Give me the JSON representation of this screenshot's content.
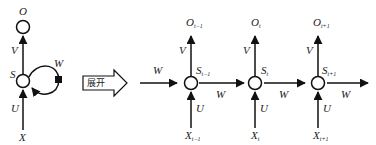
{
  "diagram": {
    "type": "rnn-unfold",
    "folded": {
      "output": "O",
      "state": "S",
      "input": "X",
      "weights": {
        "input_to_state": "U",
        "state_to_output": "V",
        "recurrent": "W"
      }
    },
    "unfold_arrow_label": "展开",
    "unrolled": [
      {
        "output": "O",
        "output_sub": "t−1",
        "state": "S",
        "state_sub": "t−1",
        "input": "X",
        "input_sub": "t−1"
      },
      {
        "output": "O",
        "output_sub": "t",
        "state": "S",
        "state_sub": "t",
        "input": "X",
        "input_sub": "t"
      },
      {
        "output": "O",
        "output_sub": "t+1",
        "state": "S",
        "state_sub": "t+1",
        "input": "X",
        "input_sub": "t+1"
      }
    ],
    "edge_labels": {
      "U": "U",
      "V": "V",
      "W": "W"
    }
  }
}
